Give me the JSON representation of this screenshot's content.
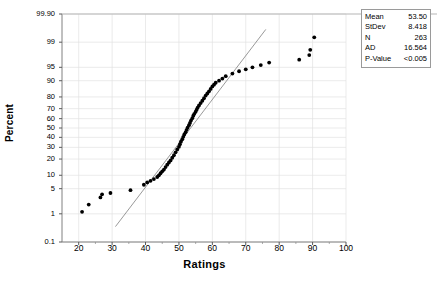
{
  "chart_data": {
    "type": "scatter",
    "title": "",
    "subtitle": "",
    "xlabel": "Ratings",
    "ylabel": "Percent",
    "plot_kind": "normal-probability-plot",
    "xlim": [
      15,
      100
    ],
    "xticks": [
      20,
      30,
      40,
      50,
      60,
      70,
      80,
      90,
      100
    ],
    "yticks": [
      0.1,
      1,
      5,
      10,
      20,
      30,
      40,
      50,
      60,
      70,
      80,
      90,
      95,
      99,
      99.9
    ],
    "ytick_labels": [
      "0.1",
      "1",
      "5",
      "10",
      "20",
      "30",
      "40",
      "50",
      "60",
      "70",
      "80",
      "90",
      "95",
      "99",
      "99.90"
    ],
    "ylim": [
      0.1,
      99.9
    ],
    "grid": true,
    "legend": "none",
    "point_color": "#000000",
    "line_color": "#7f7f7f",
    "fit_line": {
      "mean": 53.5,
      "stdev": 8.418,
      "x_start": 31.0,
      "x_end": 76.0
    },
    "series": [
      {
        "name": "Ratings",
        "points": [
          [
            21.0,
            1.15
          ],
          [
            23.0,
            1.9
          ],
          [
            26.5,
            3.0
          ],
          [
            27.0,
            3.6
          ],
          [
            29.5,
            3.9
          ],
          [
            35.5,
            4.6
          ],
          [
            39.5,
            6.2
          ],
          [
            40.5,
            7.0
          ],
          [
            41.5,
            7.6
          ],
          [
            42.5,
            8.3
          ],
          [
            43.5,
            9.2
          ],
          [
            44.0,
            10.0
          ],
          [
            44.5,
            11.0
          ],
          [
            45.0,
            12.0
          ],
          [
            45.5,
            13.0
          ],
          [
            46.0,
            14.5
          ],
          [
            46.5,
            16.0
          ],
          [
            47.0,
            17.5
          ],
          [
            47.5,
            19.0
          ],
          [
            48.0,
            21.0
          ],
          [
            48.5,
            23.0
          ],
          [
            49.0,
            25.5
          ],
          [
            49.5,
            28.0
          ],
          [
            50.0,
            30.5
          ],
          [
            50.3,
            33.0
          ],
          [
            50.6,
            35.5
          ],
          [
            51.0,
            38.0
          ],
          [
            51.3,
            40.5
          ],
          [
            51.6,
            43.0
          ],
          [
            52.0,
            45.5
          ],
          [
            52.3,
            48.0
          ],
          [
            52.6,
            50.5
          ],
          [
            53.0,
            53.0
          ],
          [
            53.3,
            55.5
          ],
          [
            53.6,
            58.0
          ],
          [
            54.0,
            60.5
          ],
          [
            54.3,
            63.0
          ],
          [
            54.6,
            65.0
          ],
          [
            55.0,
            67.0
          ],
          [
            55.3,
            69.0
          ],
          [
            55.6,
            71.0
          ],
          [
            56.0,
            73.0
          ],
          [
            56.5,
            75.0
          ],
          [
            57.0,
            77.0
          ],
          [
            57.5,
            79.0
          ],
          [
            58.0,
            81.0
          ],
          [
            58.5,
            82.5
          ],
          [
            59.0,
            84.0
          ],
          [
            59.5,
            85.5
          ],
          [
            60.0,
            87.0
          ],
          [
            60.5,
            88.0
          ],
          [
            61.0,
            89.0
          ],
          [
            62.0,
            90.0
          ],
          [
            63.0,
            91.0
          ],
          [
            64.0,
            92.0
          ],
          [
            66.0,
            93.0
          ],
          [
            68.0,
            93.8
          ],
          [
            70.0,
            94.4
          ],
          [
            72.0,
            95.0
          ],
          [
            74.5,
            95.6
          ],
          [
            77.0,
            96.2
          ],
          [
            86.0,
            96.8
          ],
          [
            89.0,
            97.6
          ],
          [
            89.3,
            98.3
          ],
          [
            90.5,
            99.3
          ]
        ]
      }
    ]
  },
  "stats": {
    "rows": [
      {
        "key": "Mean",
        "value": "53.50"
      },
      {
        "key": "StDev",
        "value": "8.418"
      },
      {
        "key": "N",
        "value": "263"
      },
      {
        "key": "AD",
        "value": "16.564"
      },
      {
        "key": "P-Value",
        "value": "<0.005"
      }
    ]
  }
}
